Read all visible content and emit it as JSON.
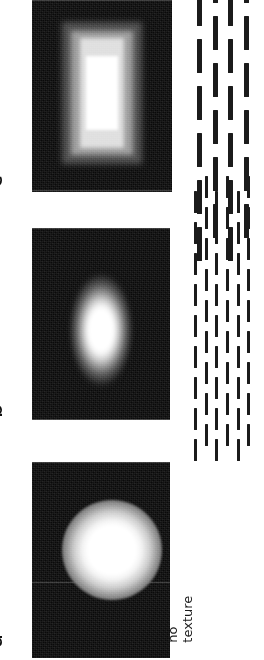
{
  "figure": {
    "orientation": "rotated-90-ccw",
    "background_color": "#ffffff",
    "ink_color": "#111111",
    "panels": [
      {
        "id": "c",
        "letter": "c",
        "condition_label": "",
        "stimulus": {
          "background_color": "#0a0a0a",
          "blob_shape": "rectangular-elongated",
          "blob_description": "vertically elongated rectangular luminance blob with blocky halo and saturated white core"
        },
        "texture": {
          "present": true,
          "type": "dashed-grating",
          "columns": 4,
          "dash_thickness": "thick",
          "dash_length": "long",
          "color": "#1b1b1b"
        }
      },
      {
        "id": "b",
        "letter": "b",
        "condition_label": "",
        "stimulus": {
          "background_color": "#0a0a0a",
          "blob_shape": "vertical-ellipse",
          "blob_description": "vertically elongated gaussian luminance blob"
        },
        "texture": {
          "present": true,
          "type": "dashed-grating",
          "columns": 6,
          "dash_thickness": "thin",
          "dash_length": "short",
          "color": "#1b1b1b"
        }
      },
      {
        "id": "a",
        "letter": "a",
        "condition_label": "no\ntexture",
        "condition_line_1": "no",
        "condition_line_2": "texture",
        "stimulus": {
          "background_color": "#0a0a0a",
          "blob_shape": "circle",
          "blob_description": "circular gaussian luminance blob"
        },
        "texture": {
          "present": false,
          "type": "none",
          "columns": 0,
          "dash_thickness": "",
          "dash_length": "",
          "color": ""
        }
      }
    ]
  }
}
